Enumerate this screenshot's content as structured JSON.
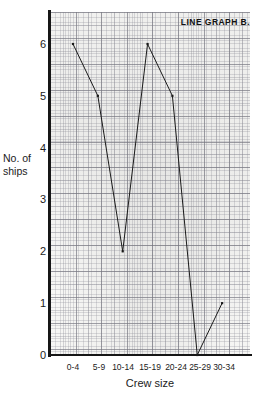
{
  "chart_data": {
    "type": "line",
    "title": "LINE GRAPH B.",
    "xlabel": "Crew size",
    "ylabel": "No. of ships",
    "ylabel_lines": [
      "No. of",
      "ships"
    ],
    "categories": [
      "0-4",
      "5-9",
      "10-14",
      "15-19",
      "20-24",
      "25-29",
      "30-34"
    ],
    "values": [
      6,
      5,
      2,
      6,
      5,
      0,
      1
    ],
    "series": [
      {
        "name": "No. of ships",
        "values": [
          6,
          5,
          2,
          6,
          5,
          0,
          1
        ]
      }
    ],
    "yticks": [
      "0",
      "1",
      "2",
      "3",
      "4",
      "5",
      "6"
    ],
    "ylim": [
      0,
      6
    ],
    "xticklabels": [
      "0-4",
      "5-9",
      "10-14",
      "15-19",
      "20-24",
      "25-29",
      "30-34"
    ],
    "grid": true,
    "grid_style": "graph-paper",
    "legend": false,
    "marker": "square-dot",
    "line_color": "#1a1a1a",
    "grid_color": "#8a8a92",
    "background_color": "#f7f7f5"
  },
  "axis": {
    "y_tick_0": "0",
    "y_tick_1": "1",
    "y_tick_2": "2",
    "y_tick_3": "3",
    "y_tick_4": "4",
    "y_tick_5": "5",
    "y_tick_6": "6"
  }
}
